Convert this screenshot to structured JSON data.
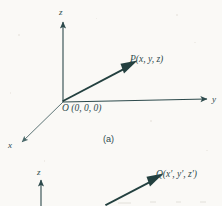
{
  "figure": {
    "background_color": "#faf9f6",
    "ink_color": "#2d4a4c",
    "panel_a": {
      "caption": "(a)",
      "axis_labels": {
        "x": "x",
        "y": "y",
        "z": "z"
      },
      "origin_label": "O (0, 0, 0)",
      "point_label": "P(x, y, z)",
      "vector": {
        "from": "O (0, 0, 0)",
        "to": "P(x, y, z)"
      }
    },
    "panel_b": {
      "axis_labels": {
        "z": "z"
      },
      "point_label": "Q(x', y', z')"
    }
  }
}
